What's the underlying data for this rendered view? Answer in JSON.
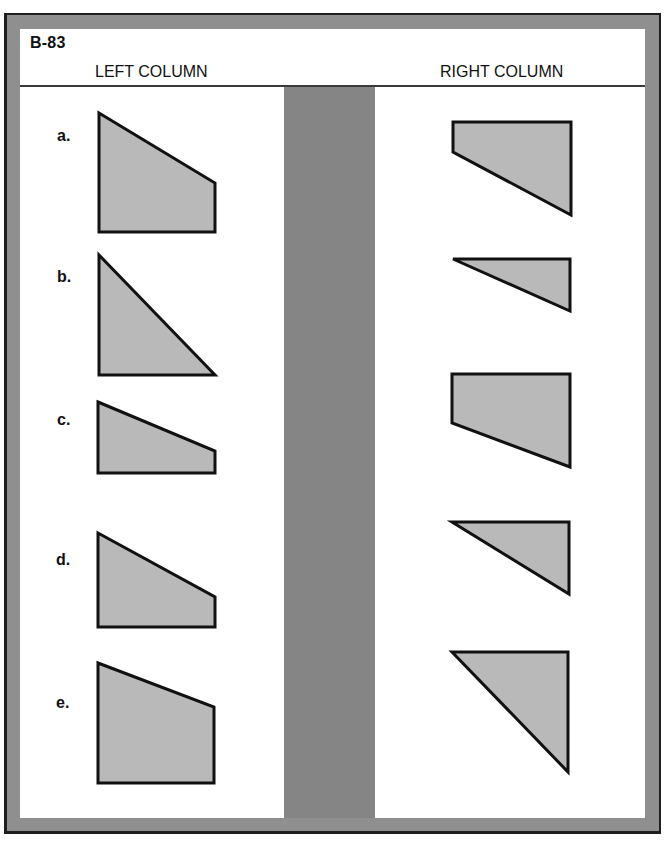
{
  "worksheet": {
    "code": "B-83",
    "left_column_title": "LEFT COLUMN",
    "right_column_title": "RIGHT COLUMN"
  },
  "colors": {
    "frame": "#8f8f8f",
    "frame_border": "#1e1e1e",
    "divider": "#858585",
    "shape_fill": "#b9b9b9",
    "shape_stroke": "#111111",
    "panel": "#ffffff"
  },
  "left_column": {
    "items": [
      {
        "label": "a.",
        "shape": "trapezoid",
        "points": "99,113 215,183 215,232 99,232"
      },
      {
        "label": "b.",
        "shape": "right-triangle",
        "points": "99,255 215,375 99,375"
      },
      {
        "label": "c.",
        "shape": "trapezoid",
        "points": "98,402 215,451 215,473 98,473"
      },
      {
        "label": "d.",
        "shape": "trapezoid",
        "points": "98,533 215,597 215,627 98,627"
      },
      {
        "label": "e.",
        "shape": "trapezoid",
        "points": "98,663 214,707 214,783 98,783"
      }
    ]
  },
  "right_column": {
    "items": [
      {
        "shape": "trapezoid",
        "points": "453,122 571,122 571,215 453,152"
      },
      {
        "shape": "right-triangle",
        "points": "453,259 570,259 570,311"
      },
      {
        "shape": "trapezoid",
        "points": "452,374 570,374 570,467 452,423"
      },
      {
        "shape": "right-triangle",
        "points": "452,522 569,522 569,594"
      },
      {
        "shape": "right-triangle",
        "points": "452,652 568,652 568,772"
      }
    ]
  }
}
